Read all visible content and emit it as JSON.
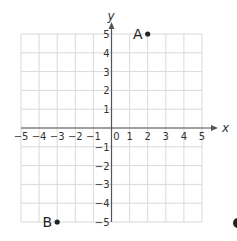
{
  "diagram": {
    "type": "coordinate-grid",
    "x_axis": {
      "label": "x",
      "min": -5,
      "max": 5,
      "ticks": [
        "−5",
        "−4",
        "−3",
        "−2",
        "−1",
        "0",
        "1",
        "2",
        "3",
        "4",
        "5"
      ]
    },
    "y_axis": {
      "label": "y",
      "min": -5,
      "max": 5,
      "ticks": [
        "5",
        "4",
        "3",
        "2",
        "1",
        "−1",
        "−2",
        "−3",
        "−4",
        "−5"
      ]
    },
    "points": [
      {
        "name": "A",
        "x": 2,
        "y": 5
      },
      {
        "name": "B",
        "x": -3,
        "y": -5
      }
    ],
    "colors": {
      "grid": "#d9d9d9",
      "axis": "#555555",
      "point": "#222222"
    }
  }
}
